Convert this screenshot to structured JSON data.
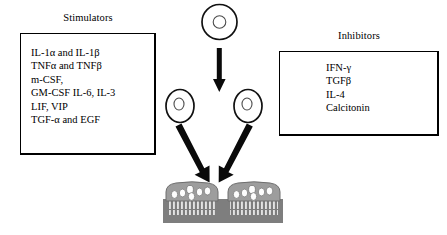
{
  "figure": {
    "name": "osteoclast-differentiation-diagram",
    "colors": {
      "ink": "#000000",
      "background": "#ffffff",
      "cell_body": "#9a9a9a",
      "bone_substrate": "#808080",
      "nucleus": "#ffffff",
      "ruffled_border": "#e8e8e8"
    }
  },
  "stimulators": {
    "title": "Stimulators",
    "items": [
      "IL-1α and IL-1β",
      "TNFα and TNFβ",
      "m-CSF,",
      "GM-CSF IL-6, IL-3",
      "LIF, VIP",
      "TGF-α and EGF"
    ]
  },
  "inhibitors": {
    "title": "Inhibitors",
    "items": [
      "IFN-γ",
      "TGFβ",
      "IL-4",
      "Calcitonin"
    ]
  },
  "cells": {
    "precursor": {
      "label": "precursor-cell"
    },
    "daughter_left": {
      "label": "mononuclear-cell-left"
    },
    "daughter_right": {
      "label": "mononuclear-cell-right"
    },
    "osteoclast_left": {
      "label": "osteoclast-left",
      "nuclei": 6
    },
    "osteoclast_right": {
      "label": "osteoclast-right",
      "nuclei": 6
    }
  },
  "arrows": {
    "division": "arrow-precursor-to-daughters",
    "fusion_left": "arrow-left-daughter-to-osteoclast",
    "fusion_right": "arrow-right-daughter-to-osteoclast"
  }
}
